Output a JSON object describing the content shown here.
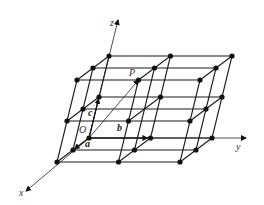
{
  "figure": {
    "type": "crystal-lattice-diagram",
    "origin": [
      89,
      138
    ],
    "basis": {
      "a": [
        -16,
        12
      ],
      "b": [
        61.5,
        0
      ],
      "c": [
        10,
        -41
      ]
    },
    "grid_size": 3,
    "point_P_index": [
      2,
      1,
      2
    ],
    "colors": {
      "line": "#1a1a1a",
      "dot": "#111111",
      "text": "#333333"
    }
  },
  "labels": {
    "z_axis": "z",
    "y_axis": "y",
    "x_axis": "x",
    "origin": "O",
    "point": "P",
    "vec_a": "a",
    "vec_b": "b",
    "vec_c": "c"
  }
}
